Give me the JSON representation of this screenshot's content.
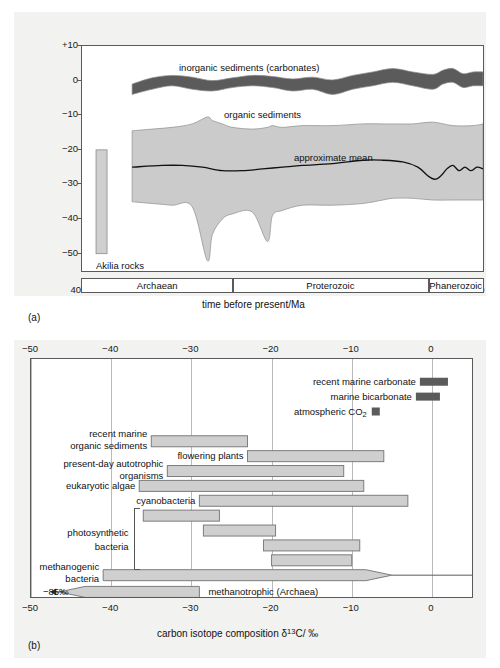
{
  "figure": {
    "panel_a_tag": "(a)",
    "panel_b_tag": "(b)"
  },
  "panel_a": {
    "ylabel": "carbon isotope composition δ13C/ ‰",
    "ylabel_parts": {
      "pre": "carbon isotope composition ",
      "delta": "δ",
      "sup": "13",
      "post": "C/ ‰"
    },
    "xlabel": "time before present/Ma",
    "y_ticks": [
      "+10",
      "0",
      "−10",
      "−20",
      "−30",
      "−40",
      "−50"
    ],
    "y_values": [
      10,
      0,
      -10,
      -20,
      -30,
      -40,
      -50
    ],
    "x_ticks": [
      "4000",
      "3500",
      "3000",
      "2500",
      "2000",
      "1500",
      "1000",
      "500",
      "0"
    ],
    "x_values": [
      4000,
      3500,
      3000,
      2500,
      2000,
      1500,
      1000,
      500,
      0
    ],
    "annotations": [
      {
        "name": "inorganic-sediments",
        "text": "inorganic sediments (carbonates)"
      },
      {
        "name": "organic-sediments",
        "text": "organic sediments"
      },
      {
        "name": "approximate-mean",
        "text": "approximate mean"
      },
      {
        "name": "akilia-rocks",
        "text": "Akilia rocks"
      }
    ],
    "eras": [
      {
        "label": "Archaean",
        "from_ma": 4000,
        "to_ma": 2500
      },
      {
        "label": "Proterozoic",
        "from_ma": 2500,
        "to_ma": 545
      },
      {
        "label": "Phanerozoic",
        "from_ma": 545,
        "to_ma": 0
      }
    ],
    "akilia_bar": {
      "from_ma": 3860,
      "to_ma": 3750,
      "d13c_top": -20,
      "d13c_bottom": -50
    },
    "colors": {
      "inorganic_band": "#5b5b5b",
      "organic_band": "#cbcbcb",
      "mean_line": "#111111",
      "akilia": "#cfcfcf"
    }
  },
  "chart_data": [
    {
      "type": "area",
      "name": "panel-a-isotope-record",
      "title": "",
      "xlabel": "time before present/Ma",
      "ylabel": "carbon isotope composition δ13C/ ‰",
      "xlim": [
        4000,
        0
      ],
      "ylim": [
        -55,
        10
      ],
      "x_reversed": true,
      "grid": false,
      "series": [
        {
          "name": "inorganic sediments (carbonates)",
          "kind": "band",
          "color": "#5b5b5b",
          "x": [
            3500,
            3300,
            3100,
            2900,
            2700,
            2500,
            2300,
            2100,
            1900,
            1700,
            1500,
            1300,
            1100,
            900,
            700,
            500,
            400,
            300,
            200,
            100,
            0
          ],
          "upper": [
            -1.0,
            0.8,
            1.5,
            1.0,
            0.0,
            0.8,
            1.5,
            1.2,
            0.5,
            1.0,
            0.2,
            1.5,
            2.5,
            3.5,
            2.5,
            1.8,
            3.0,
            3.5,
            2.0,
            2.5,
            2.5
          ],
          "lower": [
            -4.0,
            -2.5,
            -1.5,
            -2.5,
            -3.0,
            -2.0,
            -1.5,
            -2.0,
            -3.0,
            -2.5,
            -4.0,
            -2.5,
            -1.5,
            -0.5,
            -1.5,
            -2.5,
            -1.0,
            -0.5,
            -2.0,
            -1.5,
            -1.5
          ]
        },
        {
          "name": "organic sediments",
          "kind": "band",
          "color": "#cbcbcb",
          "x": [
            3500,
            3300,
            3100,
            2900,
            2750,
            2700,
            2600,
            2500,
            2300,
            2150,
            2100,
            2000,
            1800,
            1500,
            1200,
            1000,
            900,
            700,
            500,
            300,
            100,
            0
          ],
          "upper": [
            -14.5,
            -14.0,
            -13.5,
            -12.5,
            -10.5,
            -11.5,
            -12.5,
            -13.5,
            -14.0,
            -13.5,
            -13.0,
            -13.5,
            -13.0,
            -13.0,
            -12.5,
            -12.5,
            -12.5,
            -12.5,
            -12.0,
            -13.0,
            -13.0,
            -12.5
          ],
          "lower": [
            -35.0,
            -35.5,
            -36.0,
            -36.5,
            -52.0,
            -44.5,
            -40.0,
            -38.5,
            -38.0,
            -46.5,
            -39.0,
            -37.5,
            -36.0,
            -36.0,
            -35.5,
            -34.5,
            -34.0,
            -34.0,
            -34.5,
            -34.5,
            -34.5,
            -34.5
          ]
        },
        {
          "name": "approximate mean",
          "kind": "line",
          "color": "#111111",
          "x": [
            3500,
            3200,
            3000,
            2800,
            2600,
            2400,
            2200,
            2000,
            1800,
            1500,
            1200,
            1000,
            800,
            650,
            550,
            480,
            420,
            360,
            300,
            240,
            180,
            120,
            60,
            0
          ],
          "y": [
            -25.0,
            -24.5,
            -24.5,
            -25.0,
            -26.0,
            -26.0,
            -25.5,
            -25.0,
            -24.5,
            -24.0,
            -23.0,
            -23.0,
            -23.5,
            -25.0,
            -27.5,
            -28.5,
            -27.5,
            -25.5,
            -24.5,
            -26.0,
            -25.0,
            -26.0,
            -25.0,
            -25.5
          ]
        },
        {
          "name": "Akilia rocks",
          "kind": "bar",
          "color": "#cfcfcf",
          "x_range": [
            3860,
            3750
          ],
          "y_range": [
            -50,
            -20
          ]
        }
      ]
    },
    {
      "type": "bar",
      "name": "panel-b-isotope-ranges",
      "title": "",
      "xlabel": "carbon isotope composition δ13C/ ‰",
      "ylabel": "",
      "xlim": [
        -50,
        5
      ],
      "x_ticks": [
        -50,
        -40,
        -30,
        -20,
        -10,
        0
      ],
      "grid": true,
      "orientation": "horizontal",
      "ranges": [
        {
          "label": "recent marine carbonate",
          "from": -1.5,
          "to": 2.0,
          "style": "dark",
          "arrow": "none"
        },
        {
          "label": "marine bicarbonate",
          "from": -2.0,
          "to": 1.0,
          "style": "dark",
          "arrow": "none"
        },
        {
          "label": "atmospheric CO2",
          "from": -7.5,
          "to": -6.5,
          "style": "dark",
          "arrow": "none"
        },
        {
          "label": "recent marine organic sediments",
          "from": -35.0,
          "to": -23.0,
          "style": "light",
          "arrow": "none"
        },
        {
          "label": "flowering plants",
          "from": -23.0,
          "to": -6.0,
          "style": "light",
          "arrow": "none"
        },
        {
          "label": "present-day autotrophic organisms",
          "from": -33.0,
          "to": -11.0,
          "style": "light",
          "arrow": "none"
        },
        {
          "label": "eukaryotic algae",
          "from": -36.5,
          "to": -8.5,
          "style": "light",
          "arrow": "none"
        },
        {
          "label": "cyanobacteria",
          "from": -29.0,
          "to": -3.0,
          "style": "light",
          "arrow": "none"
        },
        {
          "label": "photosynthetic bacteria (1)",
          "from": -36.0,
          "to": -26.5,
          "style": "light",
          "arrow": "none"
        },
        {
          "label": "photosynthetic bacteria (2)",
          "from": -28.5,
          "to": -19.5,
          "style": "light",
          "arrow": "none"
        },
        {
          "label": "photosynthetic bacteria (3)",
          "from": -21.0,
          "to": -9.0,
          "style": "light",
          "arrow": "none"
        },
        {
          "label": "photosynthetic bacteria (4)",
          "from": -20.0,
          "to": -10.0,
          "style": "light",
          "arrow": "none"
        },
        {
          "label": "methanogenic bacteria",
          "from": -41.0,
          "to": -5.0,
          "style": "light",
          "arrow": "right"
        },
        {
          "label": "methanotrophic (Archaea)",
          "from": -85.0,
          "to": -29.0,
          "style": "light",
          "arrow": "left"
        }
      ],
      "annotations": [
        {
          "text": "−85‰",
          "at": -85.0
        }
      ]
    }
  ],
  "panel_b": {
    "xlabel_parts": {
      "pre": "carbon isotope composition ",
      "delta": "δ",
      "sup": "13",
      "post": "C/ ‰"
    },
    "x_ticks_top": [
      "−50",
      "−40",
      "−30",
      "−20",
      "−10",
      "0"
    ],
    "x_ticks_bottom": [
      "−50",
      "−40",
      "−30",
      "−20",
      "−10",
      "0"
    ],
    "labels": {
      "recent_marine_carbonate": "recent marine carbonate",
      "marine_bicarbonate": "marine bicarbonate",
      "atmospheric_co2_pre": "atmospheric CO",
      "atmospheric_co2_sub": "2",
      "recent_marine_line1": "recent marine",
      "recent_marine_line2": "organic sediments",
      "flowering_plants": "flowering plants",
      "present_day_line1": "present-day autotrophic",
      "present_day_line2": "organisms",
      "eukaryotic_algae": "eukaryotic algae",
      "cyanobacteria": "cyanobacteria",
      "photosynthetic_line1": "photosynthetic",
      "photosynthetic_line2": "bacteria",
      "methanogenic_line1": "methanogenic",
      "methanogenic_line2": "bacteria",
      "methanotrophic": "methanotrophic (Archaea)",
      "minus85": "−85‰"
    },
    "colors": {
      "light_bar": "#cfcfcf",
      "dark_bar": "#5b5b5b",
      "grid": "#b9b9b9"
    }
  }
}
